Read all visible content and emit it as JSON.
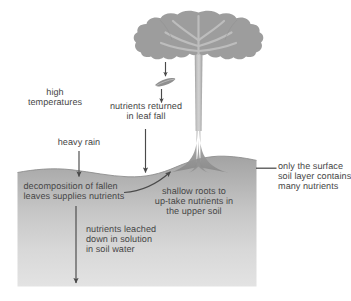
{
  "diagram": {
    "type": "soil-nutrient-cycle-diagram",
    "background_color": "#ffffff",
    "text_color": "#474747"
  },
  "labels": {
    "high_temperatures": "high\ntemperatures",
    "heavy_rain": "heavy rain",
    "nutrients_returned": "nutrients returned\nin leaf fall",
    "decomposition": "decomposition of fallen\nleaves supplies nutrients",
    "shallow_roots": "shallow roots to\nup-take nutrients in\nthe upper soil",
    "surface_soil": "only the surface\nsoil layer contains\nmany nutrients",
    "nutrients_leached": "nutrients leached\ndown in solution\nin soil water"
  },
  "elements": {
    "tree_canopy": "tree-canopy",
    "tree_trunk": "tree-trunk",
    "buttress_roots": "buttress-roots",
    "falling_leaf": "falling-leaf",
    "soil_block": "soil-block",
    "ground_surface": "ground-surface-line"
  },
  "arrows": {
    "leaf_drop_upper": "down-arrow-above-leaf",
    "leaf_drop_lower": "down-arrow-below-leaf",
    "leaf_fall_to_ground": "down-arrow-leaf-fall-to-ground",
    "heavy_rain_down": "down-arrow-heavy-rain",
    "leaching_down": "down-arrow-leaching",
    "root_uptake_curve": "curved-arrow-root-uptake",
    "surface_soil_leader": "leader-line-surface-soil"
  },
  "colors": {
    "soil_top": "#a5a5a5",
    "soil_bottom": "#e0e0e0",
    "canopy": "#9a9a9a",
    "canopy_light": "#b8b8b8",
    "trunk": "#b4b4b4",
    "arrow": "#4a4a4a",
    "text": "#474747"
  }
}
